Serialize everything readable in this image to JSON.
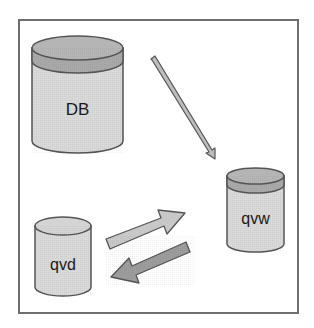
{
  "diagram": {
    "title": "",
    "nodes": [
      {
        "id": "db",
        "label": "DB",
        "shape": "cylinder",
        "top_band": true
      },
      {
        "id": "qvw",
        "label": "qvw",
        "shape": "cylinder",
        "top_band": true
      },
      {
        "id": "qvd",
        "label": "qvd",
        "shape": "cylinder",
        "top_band": false
      }
    ],
    "edges": [
      {
        "from": "db",
        "to": "qvw",
        "style": "thin-arrow"
      },
      {
        "from": "qvd",
        "to": "qvw",
        "style": "block-arrow-light"
      },
      {
        "from": "qvw",
        "to": "qvd",
        "style": "block-arrow-dark"
      }
    ],
    "colors": {
      "frame": "#6e6e6e",
      "outline": "#555555",
      "body_fill": "#d9d9d9",
      "band_fill": "#a9a9a9",
      "top_fill": "#b8b8b8",
      "arrow_light": "#c8c8c8",
      "arrow_dark": "#9a9a9a",
      "text": "#1a1a1a"
    }
  }
}
